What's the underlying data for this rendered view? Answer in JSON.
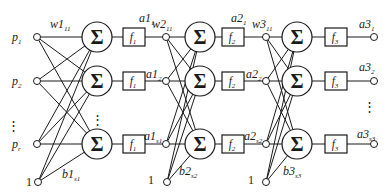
{
  "figure": {
    "background": "#ffffff",
    "ink": "#1a1a1a",
    "sum_symbol": "Σ",
    "ellipsis": "⋮",
    "bias_value": "1",
    "inputs": [
      {
        "base": "p",
        "sub": "1"
      },
      {
        "base": "p",
        "sub": "2"
      },
      {
        "base": "p",
        "sub": "r"
      }
    ],
    "layers": [
      {
        "weight": {
          "base": "w1",
          "sub": "11"
        },
        "bias": {
          "base": "b1",
          "sub": "s1"
        },
        "transfer": {
          "base": "f",
          "sub": "1"
        },
        "outputs": [
          {
            "base": "a1",
            "sub": "1"
          },
          {
            "base": "a1",
            "sub": "2"
          },
          {
            "base": "a1",
            "sub": "s1"
          }
        ]
      },
      {
        "weight": {
          "base": "w2",
          "sub": "11"
        },
        "bias": {
          "base": "b2",
          "sub": "s2"
        },
        "transfer": {
          "base": "f",
          "sub": "2"
        },
        "outputs": [
          {
            "base": "a2",
            "sub": "1"
          },
          {
            "base": "a2",
            "sub": "2"
          },
          {
            "base": "a2",
            "sub": "s2"
          }
        ]
      },
      {
        "weight": {
          "base": "w3",
          "sub": "11"
        },
        "bias": {
          "base": "b3",
          "sub": "s3"
        },
        "transfer": {
          "base": "f",
          "sub": "3"
        },
        "outputs": [
          {
            "base": "a3",
            "sub": "1"
          },
          {
            "base": "a3",
            "sub": "2"
          },
          {
            "base": "a3",
            "sub": "s3"
          }
        ]
      }
    ]
  }
}
